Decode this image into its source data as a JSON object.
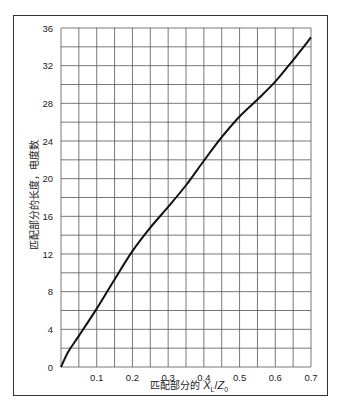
{
  "chart_data": {
    "type": "line",
    "title": "",
    "xlabel": "匹配部分的 X_L / Z_0",
    "xlabel_parts": {
      "prefix": "匹配部分的",
      "var1": "X",
      "sub1": "L",
      "sep": "/",
      "var2": "Z",
      "sub2": "0"
    },
    "ylabel": "匹配部分的长度，电度数",
    "xlim": [
      0,
      0.7
    ],
    "ylim": [
      0,
      36
    ],
    "grid": true,
    "x_grid_step": 0.05,
    "y_grid_step": 2,
    "x_ticks": [
      "0.1",
      "0.2",
      "0.3",
      "0.4",
      "0.5",
      "0.6",
      "0.7"
    ],
    "y_ticks": [
      "0",
      "4",
      "8",
      "12",
      "16",
      "20",
      "24",
      "28",
      "32",
      "36"
    ],
    "origin_label": "0",
    "series": [
      {
        "name": "length",
        "x": [
          0,
          0.02,
          0.05,
          0.1,
          0.15,
          0.2,
          0.25,
          0.3,
          0.35,
          0.4,
          0.45,
          0.5,
          0.55,
          0.6,
          0.65,
          0.7
        ],
        "y": [
          0,
          1.6,
          3.3,
          6.2,
          9.3,
          12.3,
          14.8,
          17.0,
          19.3,
          21.9,
          24.4,
          26.6,
          28.4,
          30.3,
          32.6,
          35.0
        ]
      }
    ]
  }
}
